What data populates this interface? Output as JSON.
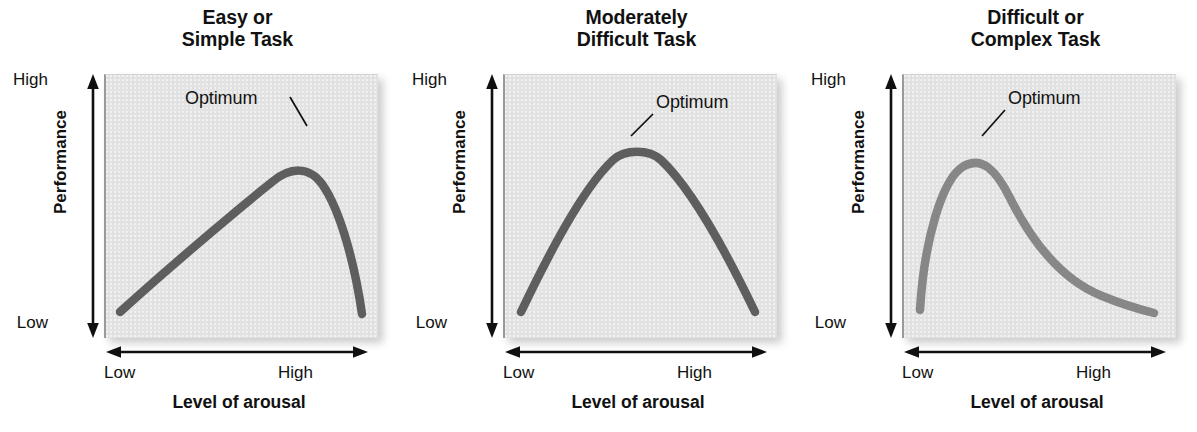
{
  "figure": {
    "name": "Arousal and performance curves (Yerkes-Dodson law)",
    "panel_count": 3,
    "background_color": "#ffffff",
    "plot_background_color": "#e3e3e3"
  },
  "axes": {
    "y_title": "Performance",
    "y_high": "High",
    "y_low": "Low",
    "x_title": "Level of arousal",
    "x_low": "Low",
    "x_high": "High"
  },
  "annotation": {
    "optimum": "Optimum"
  },
  "panels": [
    {
      "id": "easy-or-simple-task",
      "title": "Easy or\nSimple Task",
      "title_line1": "Easy or",
      "title_line2": "Simple Task",
      "curve_color": "#5e5e5e",
      "optimum_label_left": 81,
      "optimum_label_top": 14,
      "leader": {
        "x1": 186,
        "y1": 23,
        "x2": 203,
        "y2": 52
      }
    },
    {
      "id": "moderately-difficult-task",
      "title": "Moderately\nDifficult Task",
      "title_line1": "Moderately",
      "title_line2": "Difficult Task",
      "curve_color": "#5e5e5e",
      "optimum_label_left": 153,
      "optimum_label_top": 18,
      "leader": {
        "x1": 150,
        "y1": 40,
        "x2": 128,
        "y2": 62
      }
    },
    {
      "id": "difficult-or-complex-task",
      "title": "Difficult or\nComplex Task",
      "title_line1": "Difficult or",
      "title_line2": "Complex Task",
      "curve_color": "#878787",
      "optimum_label_left": 106,
      "optimum_label_top": 14,
      "leader": {
        "x1": 103,
        "y1": 36,
        "x2": 80,
        "y2": 62
      }
    }
  ],
  "chart_data": {
    "type": "line",
    "xlabel": "Level of arousal",
    "ylabel": "Performance",
    "xlim": [
      0,
      100
    ],
    "ylim": [
      0,
      100
    ],
    "xtick_labels": [
      "Low",
      "High"
    ],
    "ytick_labels": [
      "Low",
      "High"
    ],
    "grid": false,
    "legend": "none",
    "annotations": [
      "Optimum",
      "Optimum",
      "Optimum"
    ],
    "charts": [
      {
        "title": "Easy or Simple Task",
        "optimum_x": 72,
        "optimum_y": 82,
        "x": [
          5,
          15,
          25,
          35,
          45,
          55,
          62,
          68,
          72,
          76,
          82,
          88,
          93,
          96
        ],
        "y": [
          11,
          24,
          37,
          49,
          60,
          71,
          77,
          81,
          82,
          81,
          74,
          58,
          33,
          12
        ]
      },
      {
        "title": "Moderately Difficult Task",
        "optimum_x": 50,
        "optimum_y": 80,
        "x": [
          6,
          14,
          22,
          30,
          38,
          44,
          50,
          56,
          62,
          70,
          78,
          86,
          94
        ],
        "y": [
          10,
          30,
          48,
          62,
          73,
          78,
          80,
          78,
          73,
          61,
          46,
          28,
          10
        ]
      },
      {
        "title": "Difficult or Complex Task",
        "optimum_x": 24,
        "optimum_y": 76,
        "x": [
          4,
          8,
          13,
          18,
          24,
          30,
          38,
          46,
          54,
          62,
          70,
          80,
          90,
          96
        ],
        "y": [
          9,
          32,
          55,
          70,
          76,
          73,
          63,
          52,
          42,
          33,
          26,
          19,
          14,
          12
        ]
      }
    ]
  }
}
